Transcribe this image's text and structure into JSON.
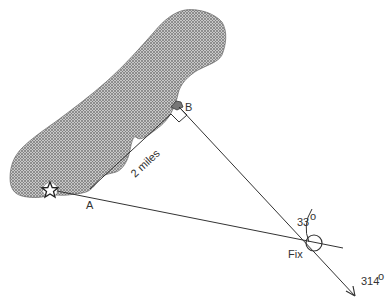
{
  "diagram": {
    "type": "navigation-fix",
    "labels": {
      "point_a": "A",
      "point_b": "B",
      "distance": "2 miles",
      "angle": "33",
      "angle_unit": "o",
      "fix": "Fix",
      "bearing": "314",
      "bearing_unit": "o"
    },
    "colors": {
      "line": "#333333",
      "land_fill": "#a8a8a8",
      "land_dots": "#555555",
      "background": "#ffffff"
    }
  }
}
